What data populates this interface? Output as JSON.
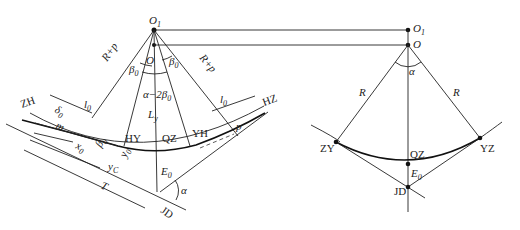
{
  "left_figure": {
    "title": "Curve with transition (spiral) curves",
    "points": {
      "O1": "O",
      "O1_sub": "1",
      "O": "O",
      "ZH": "ZH",
      "HY": "HY",
      "QZ": "QZ",
      "YH": "YH",
      "HZ": "HZ",
      "JD": "JD"
    },
    "labels": {
      "r_plus_p_left": "R+p",
      "r_plus_p_right": "R+p",
      "beta0_left": "β",
      "beta0_right": "β",
      "sub0": "0",
      "alpha_minus_2beta0": "α−2β",
      "l0_left": "l",
      "l0_right": "l",
      "Ly": "L",
      "Ly_sub": "y",
      "delta0": "δ",
      "m": "m",
      "x0": "x",
      "y0": "y",
      "yc": "y",
      "yc_sub": "C",
      "T": "T",
      "E0": "E",
      "p": "p",
      "alpha": "α",
      "O_center": "O"
    }
  },
  "right_figure": {
    "title": "Simple circular curve",
    "points": {
      "O1": "O",
      "O1_sub": "1",
      "O": "O",
      "ZY": "ZY",
      "QZ": "QZ",
      "YZ": "YZ",
      "JD": "JD"
    },
    "labels": {
      "R_left": "R",
      "R_right": "R",
      "alpha": "α",
      "E0": "E",
      "sub0": "0"
    }
  }
}
